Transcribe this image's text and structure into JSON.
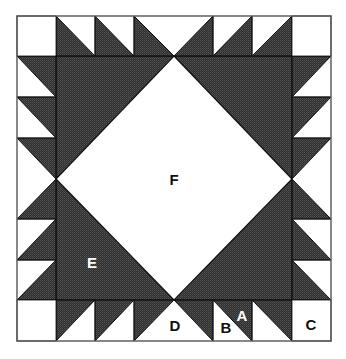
{
  "colors": {
    "dark_fill": "#3a3a3a",
    "light_fill": "#ffffff",
    "line": "#111111",
    "border": "#555555"
  },
  "labels": {
    "A": "A",
    "B": "B",
    "C": "C",
    "D": "D",
    "E": "E",
    "F": "F"
  },
  "legend_pieces": [
    {
      "id": "A",
      "desc": "dark half-square triangle"
    },
    {
      "id": "B",
      "desc": "light half-square triangle"
    },
    {
      "id": "C",
      "desc": "corner square"
    },
    {
      "id": "D",
      "desc": "light setting triangle"
    },
    {
      "id": "E",
      "desc": "large dark triangle"
    },
    {
      "id": "F",
      "desc": "center square (on point)"
    }
  ]
}
